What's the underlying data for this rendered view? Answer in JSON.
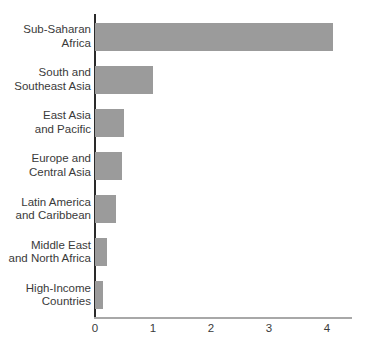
{
  "chart_data": {
    "type": "bar",
    "orientation": "horizontal",
    "title": "",
    "xlabel": "",
    "ylabel": "",
    "grid": false,
    "legend": null,
    "categories": [
      "Sub-Saharan Africa",
      "South and Southeast Asia",
      "East Asia and Pacific",
      "Europe and Central Asia",
      "Latin America and Caribbean",
      "Middle East and North Africa",
      "High-Income Countries"
    ],
    "category_lines": [
      [
        "Sub-Saharan",
        "Africa"
      ],
      [
        "South and",
        "Southeast Asia"
      ],
      [
        "East Asia",
        "and Pacific"
      ],
      [
        "Europe and",
        "Central Asia"
      ],
      [
        "Latin America",
        "and Caribbean"
      ],
      [
        "Middle East",
        "and North Africa"
      ],
      [
        "High-Income",
        "Countries"
      ]
    ],
    "values": [
      4.1,
      1.0,
      0.5,
      0.47,
      0.37,
      0.2,
      0.14
    ],
    "x_ticks": [
      "0",
      "1",
      "2",
      "3",
      "4"
    ],
    "xlim": [
      0,
      4.4
    ],
    "bar_color": "#9b9b9b",
    "y_axis_color": "#2a2a2a",
    "x_axis_color": "#a8a8a8",
    "text_color": "#3a3a3a"
  }
}
